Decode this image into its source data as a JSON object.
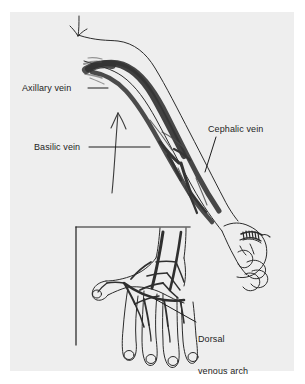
{
  "figure": {
    "kind": "anatomical-illustration",
    "panel_background": "#eeeeee",
    "page_background": "#ffffff",
    "ink_color": "#1d1d1d",
    "vein_color": "#3a3a3a"
  },
  "labels": {
    "axillary": "Axillary vein",
    "basilic": "Basilic vein",
    "cephalic": "Cephalic vein",
    "dorsal_line1": "Dorsal",
    "dorsal_line2": "venous arch"
  },
  "inset": {
    "caption": "",
    "frame": "L-shaped rule, top and left"
  }
}
